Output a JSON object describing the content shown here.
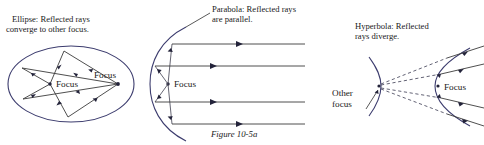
{
  "figure": {
    "caption": "Figure 10-5a",
    "panels": [
      {
        "id": "ellipse",
        "title_line1": "Ellipse: Reflected rays",
        "title_line2": "converge to other focus.",
        "labels": [
          {
            "name": "focus-left",
            "text": "Focus"
          },
          {
            "name": "focus-right",
            "text": "Focus"
          }
        ]
      },
      {
        "id": "parabola",
        "title_line1": "Parabola: Reflected rays",
        "title_line2": "are parallel.",
        "labels": [
          {
            "name": "focus",
            "text": "Focus"
          }
        ]
      },
      {
        "id": "hyperbola",
        "title_line1": "Hyperbola: Reflected",
        "title_line2": "rays diverge.",
        "labels": [
          {
            "name": "other-focus-line1",
            "text": "Other"
          },
          {
            "name": "other-focus-line2",
            "text": "focus"
          },
          {
            "name": "focus",
            "text": "Focus"
          }
        ]
      }
    ]
  },
  "colors": {
    "curve": "#3c3c6e",
    "ray": "#3b3b3b",
    "dashed": "#3b3b52",
    "text": "#1a1a1a",
    "background": "#ffffff"
  }
}
